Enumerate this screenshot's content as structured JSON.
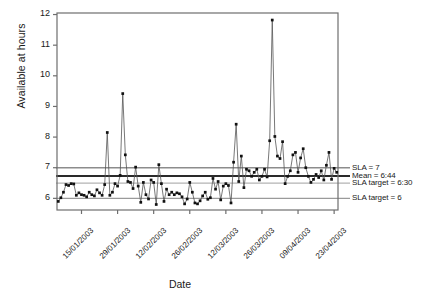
{
  "chart_data": {
    "type": "line",
    "title": "",
    "xlabel": "Date",
    "ylabel": "Available at hours",
    "ylim": [
      5.62,
      12.05
    ],
    "yticks": [
      6,
      7,
      8,
      9,
      10,
      11,
      12
    ],
    "ytick_labels": [
      "6",
      "7",
      "8",
      "9",
      "10",
      "11",
      "12"
    ],
    "grid": false,
    "legend_position": "right",
    "marker": "filled-square",
    "line_color": "#555555",
    "marker_color": "#111111",
    "x_start_date": "06/01/2003",
    "x_tick_interval_days": 14,
    "xtick_labels": [
      "15/01/2003",
      "29/01/2003",
      "12/02/2003",
      "26/02/2003",
      "12/03/2003",
      "26/03/2003",
      "09/04/2003",
      "23/04/2003"
    ],
    "xtick_indices": [
      9,
      23,
      37,
      51,
      65,
      79,
      93,
      107
    ],
    "series": [
      {
        "name": "Available at hours",
        "values": [
          5.9,
          6.02,
          6.2,
          6.45,
          6.42,
          6.48,
          6.47,
          6.1,
          6.18,
          6.12,
          6.1,
          6.05,
          6.2,
          6.12,
          6.08,
          6.28,
          6.18,
          6.1,
          6.45,
          8.15,
          6.1,
          6.2,
          6.48,
          6.4,
          6.75,
          9.42,
          7.42,
          6.55,
          6.52,
          6.32,
          7.02,
          6.4,
          5.87,
          6.52,
          6.12,
          5.98,
          6.6,
          6.52,
          5.8,
          7.1,
          6.48,
          5.9,
          6.3,
          6.12,
          6.2,
          6.12,
          6.18,
          6.15,
          6.05,
          5.82,
          5.98,
          6.52,
          6.2,
          5.85,
          5.82,
          5.92,
          6.08,
          6.2,
          5.97,
          6.02,
          6.65,
          6.3,
          6.55,
          5.95,
          6.4,
          6.48,
          6.42,
          5.85,
          7.18,
          8.42,
          6.55,
          7.38,
          6.35,
          6.95,
          6.9,
          6.72,
          6.85,
          6.95,
          6.6,
          6.72,
          6.95,
          6.7,
          7.88,
          11.82,
          8.02,
          7.38,
          7.3,
          7.85,
          6.48,
          6.72,
          6.9,
          7.42,
          7.5,
          6.85,
          7.32,
          7.62,
          7.0,
          6.72,
          6.52,
          6.62,
          6.78,
          6.68,
          6.9,
          6.6,
          7.08,
          7.5,
          6.62,
          6.98,
          6.85
        ]
      }
    ],
    "reference_lines": [
      {
        "label": "SLA = 7",
        "value": 7.0,
        "color": "#8c8c8c",
        "width": 1.6
      },
      {
        "label": "Mean = 6:44",
        "value": 6.73,
        "color": "#2a2a2a",
        "width": 1.8
      },
      {
        "label": "SLA target = 6:30",
        "value": 6.5,
        "color": "#b3b3b3",
        "width": 1.3
      },
      {
        "label": "SLA target = 6",
        "value": 6.0,
        "color": "#9a9a9a",
        "width": 1.3
      }
    ],
    "legend_entries": [
      "SLA = 7",
      "Mean = 6:44",
      "SLA target = 6:30",
      "SLA target = 6"
    ]
  }
}
